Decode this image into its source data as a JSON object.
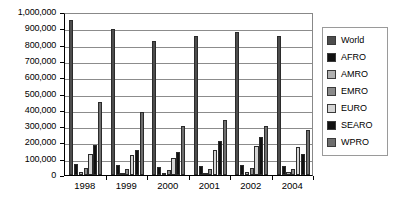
{
  "chart_data": {
    "type": "bar",
    "title": "",
    "subtitle": "",
    "xlabel": "",
    "ylabel": "",
    "grid": true,
    "grid_axis": "y",
    "legend_position": "right",
    "ylim": [
      0,
      1000000
    ],
    "ytick_step": 100000,
    "ytick_labels": [
      "1,000,000",
      "900,000",
      "800,000",
      "700,000",
      "600,000",
      "500,000",
      "400,000",
      "300,000",
      "200,000",
      "100,000",
      "0"
    ],
    "ytick_values": [
      1000000,
      900000,
      800000,
      700000,
      600000,
      500000,
      400000,
      300000,
      200000,
      100000,
      0
    ],
    "categories": [
      "1998",
      "1999",
      "2000",
      "2001",
      "2002",
      "2004"
    ],
    "series": [
      {
        "name": "World",
        "color": "#4d4d4d",
        "values": [
          950000,
          895000,
          825000,
          855000,
          880000,
          855000
        ]
      },
      {
        "name": "AFRO",
        "color": "#111111",
        "values": [
          70000,
          62000,
          48000,
          55000,
          60000,
          58000
        ]
      },
      {
        "name": "AMRO",
        "color": "#b0b0b0",
        "values": [
          18000,
          14000,
          12000,
          14000,
          16000,
          16000
        ]
      },
      {
        "name": "EMRO",
        "color": "#8a8a8a",
        "values": [
          42000,
          38000,
          32000,
          36000,
          40000,
          38000
        ]
      },
      {
        "name": "EURO",
        "color": "#d4d4d4",
        "values": [
          130000,
          120000,
          105000,
          155000,
          175000,
          172000
        ]
      },
      {
        "name": "SEARO",
        "color": "#111111",
        "values": [
          185000,
          155000,
          140000,
          210000,
          235000,
          130000
        ]
      },
      {
        "name": "WPRO",
        "color": "#6e6e6e",
        "values": [
          450000,
          385000,
          300000,
          340000,
          300000,
          275000
        ]
      }
    ]
  },
  "legend": {
    "items": [
      {
        "label": "World"
      },
      {
        "label": "AFRO"
      },
      {
        "label": "AMRO"
      },
      {
        "label": "EMRO"
      },
      {
        "label": "EURO"
      },
      {
        "label": "SEARO"
      },
      {
        "label": "WPRO"
      }
    ]
  }
}
